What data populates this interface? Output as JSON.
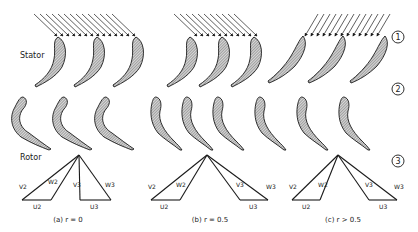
{
  "labels": {
    "stator": "Stator",
    "rotor": "Rotor"
  },
  "stations": [
    "1",
    "2",
    "3"
  ],
  "cases": [
    {
      "caption": "(a) r = 0",
      "vectors": {
        "v2": "V2",
        "w2": "W2",
        "u2": "U2",
        "v3": "V3",
        "w3": "W3",
        "u3": "U3"
      }
    },
    {
      "caption": "(b) r = 0.5",
      "vectors": {
        "v2": "V2",
        "w2": "W2",
        "u2": "U2",
        "v3": "V3",
        "w3": "W3",
        "u3": "U3"
      }
    },
    {
      "caption": "(c) r > 0.5",
      "vectors": {
        "v2": "V2",
        "w2": "W2",
        "u2": "U2",
        "v3": "V3",
        "w3": "W3",
        "u3": "U3"
      }
    }
  ],
  "colors": {
    "ink": "#1a1a1a",
    "hatch": "#777777",
    "background": "#ffffff"
  }
}
